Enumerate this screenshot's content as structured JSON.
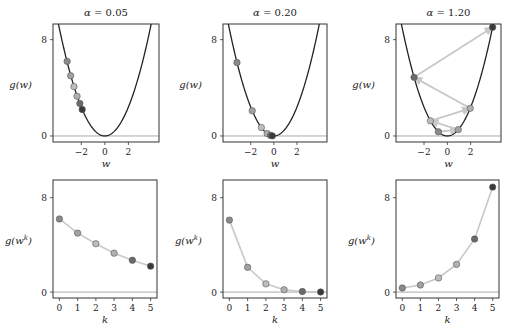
{
  "figure": {
    "function_label": "g(w)",
    "curve_coefficient": 0.6,
    "marker_colors": [
      "#8a8a8a",
      "#a2a2a2",
      "#bdbdbd",
      "#b0b0b0",
      "#6a6a6a",
      "#3a3a3a"
    ],
    "trace_color": "#c8c8c8",
    "curve_color": "#222222",
    "zero_line_color": "#aaaaaa"
  },
  "chart_data": [
    {
      "type": "line",
      "panel": "top-left",
      "title": "α = 0.05",
      "xlabel": "w",
      "ylabel": "g(w)",
      "xticks": [
        -2,
        0,
        2
      ],
      "yticks": [
        0,
        8
      ],
      "xlim": [
        -4.4,
        4.6
      ],
      "ylim": [
        -0.5,
        9.3
      ],
      "steps_w": [
        -3.2,
        -2.9,
        -2.62,
        -2.36,
        -2.12,
        -1.92
      ],
      "steps_g": [
        6.2,
        5.0,
        4.1,
        3.3,
        2.7,
        2.2
      ]
    },
    {
      "type": "line",
      "panel": "top-middle",
      "title": "α = 0.20",
      "xlabel": "w",
      "ylabel": "g(w)",
      "xticks": [
        -2,
        0,
        2
      ],
      "yticks": [
        0,
        8
      ],
      "xlim": [
        -4.4,
        4.6
      ],
      "ylim": [
        -0.5,
        9.3
      ],
      "steps_w": [
        -3.19,
        -1.87,
        -1.08,
        -0.58,
        -0.29,
        -0.13
      ],
      "steps_g": [
        6.1,
        2.1,
        0.7,
        0.2,
        0.05,
        0.01
      ]
    },
    {
      "type": "line",
      "panel": "top-right",
      "title": "α = 1.20",
      "xlabel": "w",
      "ylabel": "g(w)",
      "xticks": [
        -2,
        0,
        2
      ],
      "yticks": [
        0,
        8
      ],
      "xlim": [
        -4.4,
        4.6
      ],
      "ylim": [
        -0.5,
        9.3
      ],
      "steps_w": [
        -0.77,
        0.94,
        -1.45,
        1.96,
        -2.85,
        3.88
      ],
      "steps_g": [
        0.35,
        0.53,
        1.26,
        2.3,
        4.87,
        9.03
      ]
    },
    {
      "type": "line",
      "panel": "bottom-left",
      "title": "",
      "xlabel": "k",
      "ylabel": "g(w^k)",
      "xticks": [
        0,
        1,
        2,
        3,
        4,
        5
      ],
      "yticks": [
        0,
        8
      ],
      "xlim": [
        -0.35,
        5.35
      ],
      "ylim": [
        -0.5,
        9.5
      ],
      "k": [
        0,
        1,
        2,
        3,
        4,
        5
      ],
      "values": [
        6.2,
        5.0,
        4.1,
        3.3,
        2.7,
        2.2
      ]
    },
    {
      "type": "line",
      "panel": "bottom-middle",
      "title": "",
      "xlabel": "k",
      "ylabel": "g(w^k)",
      "xticks": [
        0,
        1,
        2,
        3,
        4,
        5
      ],
      "yticks": [
        0,
        8
      ],
      "xlim": [
        -0.35,
        5.35
      ],
      "ylim": [
        -0.5,
        9.5
      ],
      "k": [
        0,
        1,
        2,
        3,
        4,
        5
      ],
      "values": [
        6.1,
        2.1,
        0.7,
        0.2,
        0.05,
        0.01
      ]
    },
    {
      "type": "line",
      "panel": "bottom-right",
      "title": "",
      "xlabel": "k",
      "ylabel": "g(w^k)",
      "xticks": [
        0,
        1,
        2,
        3,
        4,
        5
      ],
      "yticks": [
        0,
        8
      ],
      "xlim": [
        -0.35,
        5.35
      ],
      "ylim": [
        -0.5,
        9.5
      ],
      "k": [
        0,
        1,
        2,
        3,
        4,
        5
      ],
      "values": [
        0.35,
        0.6,
        1.2,
        2.35,
        4.5,
        8.9
      ]
    }
  ]
}
